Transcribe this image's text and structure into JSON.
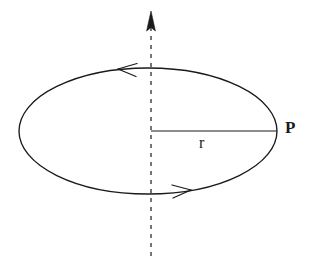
{
  "figure": {
    "background_color": "#ffffff",
    "stroke_color": "#1a1a1a",
    "width": 311,
    "height": 268
  },
  "labels": {
    "point_label": "P",
    "radius_label": "r"
  },
  "shapes": {
    "ellipse": {
      "name": "orbit-ellipse",
      "center_x": 148,
      "center_y": 131,
      "radius_x": 129,
      "radius_y": 63,
      "stroke_width": 1.3,
      "fill": "none"
    },
    "axis": {
      "name": "vertical-rotation-axis",
      "x": 151,
      "y_top": 12,
      "y_bottom": 258,
      "dash_pattern": "4 5",
      "stroke_width": 1.2,
      "arrow_direction": "up"
    },
    "radius_line": {
      "name": "radius-segment",
      "x_start": 151,
      "x_end": 277,
      "y": 131,
      "stroke_width": 1.2
    },
    "direction_arrow_top": {
      "name": "direction-arrow-top",
      "tip_x": 118,
      "tip_y": 69,
      "points": "left"
    },
    "direction_arrow_bottom": {
      "name": "direction-arrow-bottom",
      "tip_x": 190,
      "tip_y": 190,
      "points": "right"
    }
  }
}
